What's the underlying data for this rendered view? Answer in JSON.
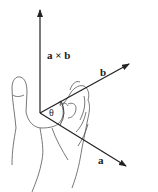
{
  "diagram": {
    "labels": {
      "cross": "a × b",
      "b": "b",
      "a": "a",
      "theta": "θ"
    },
    "vectors": [
      {
        "name": "a × b",
        "from": [
          40,
          113
        ],
        "to": [
          40,
          10
        ]
      },
      {
        "name": "b",
        "from": [
          40,
          113
        ],
        "to": [
          129,
          64
        ]
      },
      {
        "name": "a",
        "from": [
          40,
          113
        ],
        "to": [
          126,
          166
        ]
      }
    ],
    "colors": {
      "line": "#222222",
      "hand": "#555555"
    }
  }
}
